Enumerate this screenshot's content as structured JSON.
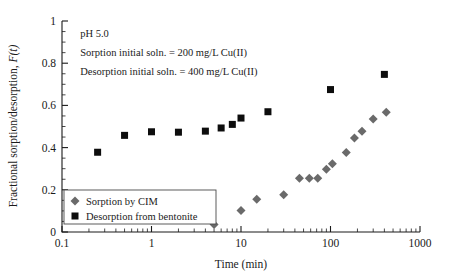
{
  "chart_data": {
    "type": "scatter",
    "title": "",
    "xlabel": "Time (min)",
    "ylabel": "Fractional sorption/desorption, F(t)",
    "xscale": "log",
    "yscale": "linear",
    "xlim": [
      0.1,
      1000
    ],
    "ylim": [
      0,
      1
    ],
    "grid": false,
    "xticks": [
      0.1,
      1,
      10,
      100,
      1000
    ],
    "xticklabels": [
      "0.1",
      "1",
      "10",
      "100",
      "1000"
    ],
    "yticks": [
      0,
      0.2,
      0.4,
      0.6,
      0.8,
      1
    ],
    "yticklabels": [
      "0",
      "0.2",
      "0.4",
      "0.6",
      "0.8",
      "1"
    ],
    "y_minor_step": 0.05,
    "legend_position": "lower-left-inside",
    "series": [
      {
        "name": "Sorption by CIM",
        "marker": "diamond",
        "color": "#6a6a6a",
        "points": [
          {
            "x": 5,
            "y": 0.035
          },
          {
            "x": 10,
            "y": 0.102
          },
          {
            "x": 15,
            "y": 0.155
          },
          {
            "x": 30,
            "y": 0.177
          },
          {
            "x": 45,
            "y": 0.255
          },
          {
            "x": 58,
            "y": 0.255
          },
          {
            "x": 72,
            "y": 0.255
          },
          {
            "x": 90,
            "y": 0.297
          },
          {
            "x": 105,
            "y": 0.323
          },
          {
            "x": 150,
            "y": 0.377
          },
          {
            "x": 185,
            "y": 0.445
          },
          {
            "x": 225,
            "y": 0.477
          },
          {
            "x": 300,
            "y": 0.535
          },
          {
            "x": 420,
            "y": 0.568
          }
        ]
      },
      {
        "name": "Desorption from bentonite",
        "marker": "square",
        "color": "#0d0d0d",
        "points": [
          {
            "x": 0.25,
            "y": 0.378
          },
          {
            "x": 0.5,
            "y": 0.458
          },
          {
            "x": 1,
            "y": 0.475
          },
          {
            "x": 2,
            "y": 0.473
          },
          {
            "x": 4,
            "y": 0.478
          },
          {
            "x": 6,
            "y": 0.493
          },
          {
            "x": 8,
            "y": 0.51
          },
          {
            "x": 10,
            "y": 0.54
          },
          {
            "x": 20,
            "y": 0.57
          },
          {
            "x": 100,
            "y": 0.675
          },
          {
            "x": 400,
            "y": 0.747
          }
        ]
      }
    ],
    "annotations": [
      {
        "text": "pH 5.0",
        "x": 0.16,
        "y": 0.945
      },
      {
        "text": "Sorption initial soln. = 200 mg/L Cu(II)",
        "x": 0.16,
        "y": 0.855
      },
      {
        "text": "Desorption initial soln. = 400 mg/L Cu(II)",
        "x": 0.16,
        "y": 0.762
      }
    ]
  },
  "legend": {
    "entries": [
      {
        "label": "Sorption by CIM",
        "marker": "diamond-marker-icon"
      },
      {
        "label": "Desorption from bentonite",
        "marker": "square-marker-icon"
      }
    ]
  }
}
